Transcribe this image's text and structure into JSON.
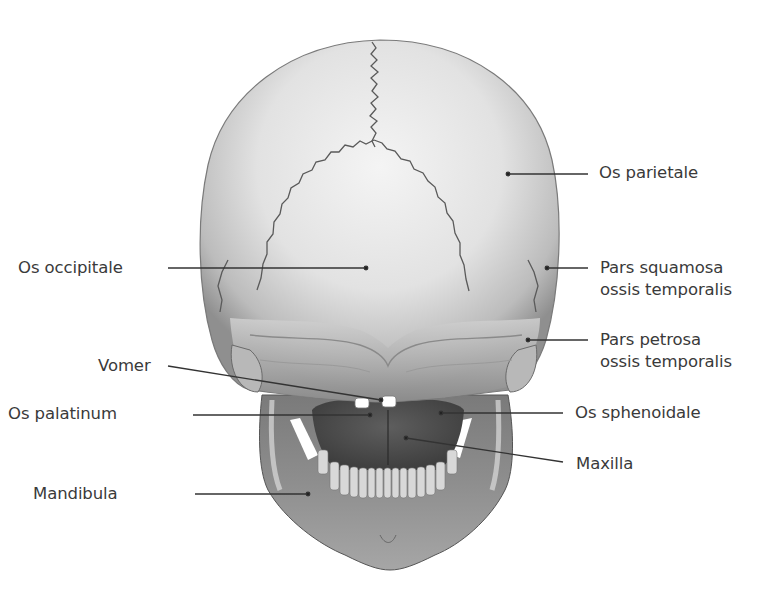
{
  "figure": {
    "view": "Skull, posterior view",
    "labels_left": [
      {
        "id": "os-occipitale",
        "text": "Os occipitale",
        "x": 18,
        "y": 257
      },
      {
        "id": "vomer",
        "text": "Vomer",
        "x": 98,
        "y": 356
      },
      {
        "id": "os-palatinum",
        "text": "Os palatinum",
        "x": 8,
        "y": 403
      },
      {
        "id": "mandibula",
        "text": "Mandibula",
        "x": 33,
        "y": 483
      }
    ],
    "labels_right": [
      {
        "id": "os-parietale",
        "text": "Os parietale",
        "x": 599,
        "y": 162
      },
      {
        "id": "pars-squamosa",
        "line1": "Pars squamosa",
        "line2": "ossis temporalis",
        "x": 600,
        "y": 257
      },
      {
        "id": "pars-petrosa",
        "line1": "Pars petrosa",
        "line2": "ossis temporalis",
        "x": 600,
        "y": 330
      },
      {
        "id": "os-sphenoidale",
        "text": "Os sphenoidale",
        "x": 575,
        "y": 403
      },
      {
        "id": "maxilla",
        "text": "Maxilla",
        "x": 576,
        "y": 455
      }
    ],
    "colors": {
      "label_text": "#3a3a3a",
      "leader_line": "#333333",
      "bone_light": "#ededed",
      "bone_mid": "#bdbdbd",
      "bone_dark": "#6e6e6e",
      "suture": "#5a5a5a"
    }
  }
}
